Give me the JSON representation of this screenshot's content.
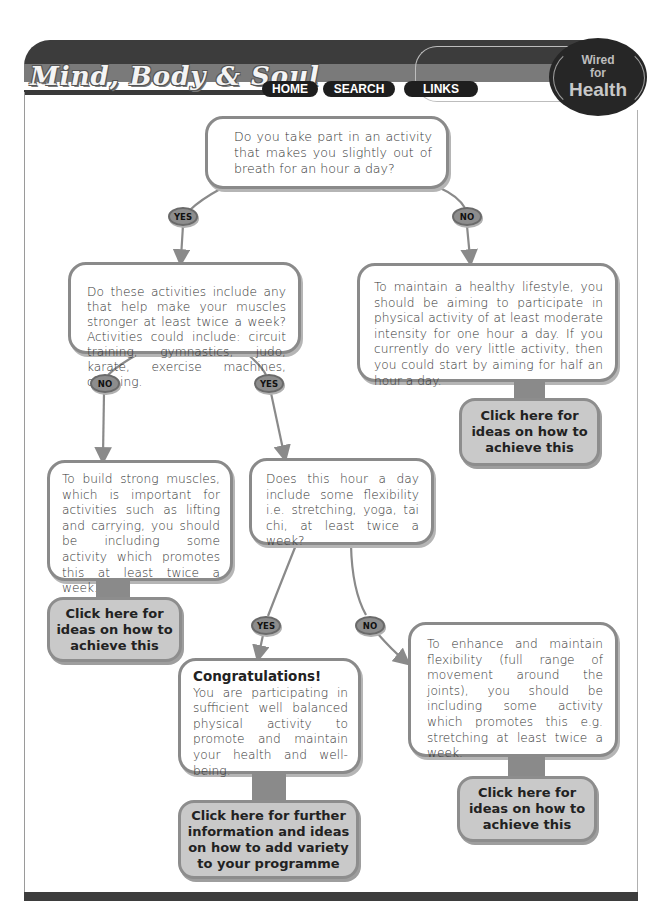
{
  "header": {
    "site_title": "Mind, Body & Soul",
    "nav": [
      {
        "label": "HOME"
      },
      {
        "label": "SEARCH"
      },
      {
        "label": "LINKS"
      }
    ],
    "logo": {
      "line1": "Wired",
      "line2": "for",
      "line3": "Health"
    }
  },
  "flowchart": {
    "q1": {
      "text": "Do you take part in an activity that makes you slightly out of breath for an hour a day?"
    },
    "q1_yes": "YES",
    "q1_no": "NO",
    "q2": {
      "text": "Do these activities include any that help make your muscles stronger at least twice a week? Activities could include: circuit training, gymnastics, judo, karate, exercise machines, climbing."
    },
    "r_no_activity": {
      "text": "To maintain a healthy lifestyle, you should be aiming to participate in physical activity of at least moderate intensity for one hour a day. If you currently do very little activity, then you could start by aiming for half an hour a day.",
      "button": "Click here for ideas on how to achieve this"
    },
    "q2_no": "NO",
    "q2_yes": "YES",
    "r_no_strength": {
      "text": "To build strong muscles, which is important for activities such as lifting and carrying, you should be including some activity which promotes this at least twice a week.",
      "button": "Click here for ideas on how to achieve this"
    },
    "q3": {
      "text": "Does this hour a day include some flexibility i.e. stretching, yoga, tai chi, at least twice a week?"
    },
    "q3_yes": "YES",
    "q3_no": "NO",
    "r_congrats": {
      "title": "Congratulations!",
      "text": "You are participating in sufficient well balanced physical activity to promote and maintain your health and well-being.",
      "button": "Click here for further information and ideas on how to add variety to your programme"
    },
    "r_no_flex": {
      "text": "To enhance and maintain flexibility (full range of movement around the joints), you should be including some activity which promotes this e.g. stretching at least twice a week.",
      "button": "Click here for ideas on how to achieve this"
    }
  },
  "colors": {
    "header_dark": "#3c3c3c",
    "header_mid": "#7a7a7a",
    "box_border": "#8a8a8a",
    "button_fill": "#c9c9c9",
    "badge_fill": "#8d8d8d"
  }
}
